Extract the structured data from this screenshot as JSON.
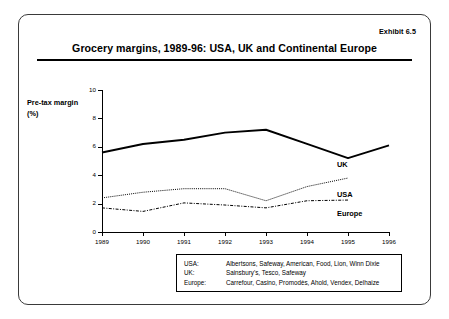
{
  "exhibit": {
    "label": "Exhibit 6.5"
  },
  "header": {
    "title": "Grocery margins, 1989-96: USA, UK and Continental Europe"
  },
  "axis_caption": {
    "line1": "Pre-tax margin",
    "line2": "(%)"
  },
  "series_labels": {
    "uk": "UK",
    "usa": "USA",
    "europe": "Europe"
  },
  "legend_box": {
    "rows": [
      {
        "key": "USA:",
        "value": "Albertsons, Safeway, American, Food, Lion, Winn Dixie"
      },
      {
        "key": "UK:",
        "value": "Sainsbury's, Tesco, Safeway"
      },
      {
        "key": "Europe:",
        "value": "Carrefour, Casino, Promodès, Ahold, Vendex, Delhaize"
      }
    ]
  },
  "chart_data": {
    "type": "line",
    "title": "Grocery margins, 1989-96: USA, UK and Continental Europe",
    "xlabel": "",
    "ylabel": "Pre-tax margin (%)",
    "x": [
      1989,
      1990,
      1991,
      1992,
      1993,
      1994,
      1995,
      1996
    ],
    "xtick_labels": [
      "1989",
      "1990",
      "1991",
      "1992",
      "1993",
      "1994",
      "1995",
      "1996"
    ],
    "ytick_labels": [
      "0",
      "2",
      "4",
      "6",
      "8",
      "10"
    ],
    "yticks": [
      0,
      2,
      4,
      6,
      8,
      10
    ],
    "ylim": [
      0,
      10
    ],
    "xlim": [
      1989,
      1996
    ],
    "grid": false,
    "legend_position": "right-inline",
    "series": [
      {
        "name": "UK",
        "style": "solid",
        "x": [
          1989,
          1990,
          1991,
          1992,
          1993,
          1994,
          1995,
          1996
        ],
        "values": [
          5.6,
          6.2,
          6.5,
          7.0,
          7.2,
          6.2,
          5.2,
          6.1
        ]
      },
      {
        "name": "USA",
        "style": "dotted",
        "x": [
          1989,
          1990,
          1991,
          1992,
          1993,
          1994,
          1995,
          1996
        ],
        "values": [
          2.4,
          2.8,
          3.05,
          3.05,
          2.2,
          3.2,
          3.8,
          null
        ]
      },
      {
        "name": "Europe",
        "style": "dash-dot",
        "x": [
          1989,
          1990,
          1991,
          1992,
          1993,
          1994,
          1995,
          1996
        ],
        "values": [
          1.7,
          1.45,
          2.05,
          1.9,
          1.7,
          2.2,
          2.25,
          null
        ]
      }
    ]
  }
}
